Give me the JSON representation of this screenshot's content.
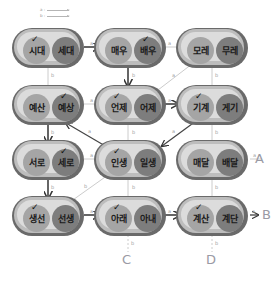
{
  "legend": [
    {
      "label": "a :"
    },
    {
      "label": "b :"
    }
  ],
  "nodes": [
    {
      "id": "n11",
      "left": "시대",
      "right": "세대",
      "check": "left"
    },
    {
      "id": "n12",
      "left": "매우",
      "right": "배우",
      "check": "right"
    },
    {
      "id": "n13",
      "left": "모레",
      "right": "무레",
      "check": "none"
    },
    {
      "id": "n21",
      "left": "예산",
      "right": "예상",
      "check": "right"
    },
    {
      "id": "n22",
      "left": "언제",
      "right": "어제",
      "check": "left"
    },
    {
      "id": "n23",
      "left": "기계",
      "right": "게기",
      "check": "left"
    },
    {
      "id": "n31",
      "left": "서로",
      "right": "세로",
      "check": "right"
    },
    {
      "id": "n32",
      "left": "인생",
      "right": "일생",
      "check": "left"
    },
    {
      "id": "n33",
      "left": "매달",
      "right": "배달",
      "check": "none"
    },
    {
      "id": "n41",
      "left": "생선",
      "right": "선생",
      "check": "left"
    },
    {
      "id": "n42",
      "left": "아래",
      "right": "아내",
      "check": "left"
    },
    {
      "id": "n43",
      "left": "계산",
      "right": "계단",
      "check": "left"
    }
  ],
  "edge_labels": {
    "a": "a",
    "b": "b"
  },
  "end_labels": {
    "A": "A",
    "B": "B",
    "C": "C",
    "D": "D"
  }
}
